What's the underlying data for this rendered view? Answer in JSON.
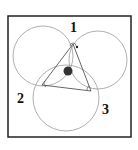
{
  "diagram": {
    "type": "geometric-figure",
    "frame": {
      "x": 8,
      "y": 16,
      "width": 123,
      "height": 121,
      "stroke": "#222222"
    },
    "circles": [
      {
        "id": "left",
        "cx": 43,
        "cy": 56,
        "r": 30
      },
      {
        "id": "right",
        "cx": 98,
        "cy": 60,
        "r": 29
      },
      {
        "id": "bottom",
        "cx": 66,
        "cy": 98,
        "r": 33
      }
    ],
    "triangle": {
      "vertices": [
        {
          "id": "1",
          "x": 73,
          "y": 44
        },
        {
          "id": "2",
          "x": 42,
          "y": 85
        },
        {
          "id": "3",
          "x": 91,
          "y": 91
        }
      ]
    },
    "labels": [
      {
        "text": "1",
        "x": 70,
        "y": 32
      },
      {
        "text": "2",
        "x": 17,
        "y": 103
      },
      {
        "text": "3",
        "x": 102,
        "y": 114
      }
    ],
    "center_dot": {
      "cx": 68,
      "cy": 71,
      "r": 4.5,
      "color": "#333333"
    },
    "marker_dot": {
      "cx": 77,
      "cy": 47,
      "r": 1.2
    },
    "colors": {
      "circle_stroke": "#9a9a9a",
      "triangle_stroke": "#555555",
      "frame": "#222222"
    }
  }
}
